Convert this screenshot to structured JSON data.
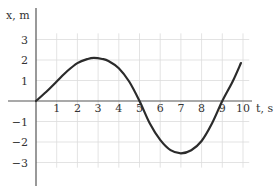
{
  "chart_data": {
    "type": "line",
    "title": "",
    "xlabel": "t, s",
    "ylabel": "x, m",
    "xlim": [
      0,
      10
    ],
    "ylim": [
      -3,
      3
    ],
    "x_ticks": [
      1,
      2,
      3,
      4,
      5,
      6,
      7,
      8,
      9,
      10
    ],
    "y_ticks": [
      3,
      2,
      1,
      -1,
      -2,
      -3
    ],
    "y_tick_labels": [
      "3",
      "2",
      "1",
      "−1",
      "−2",
      "−3"
    ],
    "grid": true,
    "legend": null,
    "series": [
      {
        "name": "x(t)",
        "color": "#2b2b2b",
        "points": [
          [
            0,
            0
          ],
          [
            0.5,
            0.45
          ],
          [
            1,
            0.95
          ],
          [
            1.5,
            1.45
          ],
          [
            2,
            1.85
          ],
          [
            2.5,
            2.05
          ],
          [
            2.8,
            2.1
          ],
          [
            3.2,
            2.05
          ],
          [
            3.5,
            1.95
          ],
          [
            4,
            1.6
          ],
          [
            4.5,
            0.95
          ],
          [
            5,
            0
          ],
          [
            5.5,
            -1.1
          ],
          [
            6,
            -1.9
          ],
          [
            6.5,
            -2.4
          ],
          [
            7,
            -2.55
          ],
          [
            7.5,
            -2.4
          ],
          [
            8,
            -1.95
          ],
          [
            8.5,
            -1.1
          ],
          [
            9,
            0
          ],
          [
            9.5,
            0.95
          ],
          [
            9.9,
            1.85
          ]
        ]
      }
    ]
  },
  "colors": {
    "grid": "#dcdcdc",
    "axis": "#555555",
    "curve": "#2b2b2b",
    "text": "#333333"
  }
}
